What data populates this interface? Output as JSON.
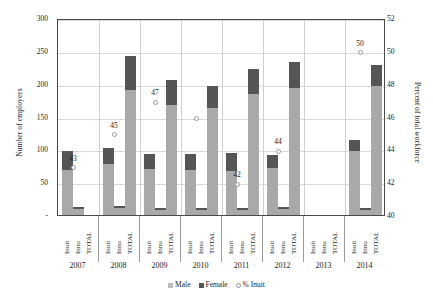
{
  "chart_data": {
    "type": "bar",
    "title": "",
    "subtitle": "",
    "grid": true,
    "legend_position": "bottom",
    "ylabel": "Number of employees",
    "y2label": "Percent of total workforce",
    "xlabel": "",
    "ylim": [
      0,
      300
    ],
    "yticks": [
      "-",
      "50",
      "100",
      "150",
      "200",
      "250",
      "300"
    ],
    "ytick_values": [
      0,
      50,
      100,
      150,
      200,
      250,
      300
    ],
    "y2lim": [
      40,
      52
    ],
    "y2ticks": [
      "40",
      "42",
      "44",
      "46",
      "48",
      "50",
      "52"
    ],
    "y2tick_values": [
      40,
      42,
      44,
      46,
      48,
      50,
      52
    ],
    "categories": [
      "Inuit",
      "Innu",
      "TOTAL"
    ],
    "groups": [
      "2007",
      "2008",
      "2009",
      "2010",
      "2011",
      "2012",
      "2013",
      "2014"
    ],
    "series": [
      {
        "name": "Male",
        "color": "#a9a9a9"
      },
      {
        "name": "Female",
        "color": "#555555"
      },
      {
        "name": "% Inuit",
        "color": "#fdfdfd"
      }
    ],
    "legend_entries": [
      "Male",
      "Female",
      "% Inuit"
    ],
    "bars": [
      {
        "group": "2007",
        "category": "Inuit",
        "male": 68,
        "female": 29,
        "total": 97
      },
      {
        "group": "2007",
        "category": "Innu",
        "male": 9,
        "female": 3,
        "total": 12
      },
      {
        "group": "2007",
        "category": "TOTAL",
        "male": 0,
        "female": 0,
        "total": 0
      },
      {
        "group": "2008",
        "category": "Inuit",
        "male": 77,
        "female": 25,
        "total": 102
      },
      {
        "group": "2008",
        "category": "Innu",
        "male": 10,
        "female": 4,
        "total": 14
      },
      {
        "group": "2008",
        "category": "TOTAL",
        "male": 190,
        "female": 52,
        "total": 242
      },
      {
        "group": "2009",
        "category": "Inuit",
        "male": 70,
        "female": 23,
        "total": 93
      },
      {
        "group": "2009",
        "category": "Innu",
        "male": 8,
        "female": 3,
        "total": 11
      },
      {
        "group": "2009",
        "category": "TOTAL",
        "male": 167,
        "female": 39,
        "total": 206
      },
      {
        "group": "2010",
        "category": "Inuit",
        "male": 69,
        "female": 24,
        "total": 93
      },
      {
        "group": "2010",
        "category": "Innu",
        "male": 7,
        "female": 3,
        "total": 10
      },
      {
        "group": "2010",
        "category": "TOTAL",
        "male": 163,
        "female": 34,
        "total": 197
      },
      {
        "group": "2011",
        "category": "Inuit",
        "male": 67,
        "female": 27,
        "total": 94
      },
      {
        "group": "2011",
        "category": "Innu",
        "male": 8,
        "female": 3,
        "total": 11
      },
      {
        "group": "2011",
        "category": "TOTAL",
        "male": 184,
        "female": 38,
        "total": 222
      },
      {
        "group": "2012",
        "category": "Inuit",
        "male": 72,
        "female": 20,
        "total": 92
      },
      {
        "group": "2012",
        "category": "Innu",
        "male": 9,
        "female": 3,
        "total": 12
      },
      {
        "group": "2012",
        "category": "TOTAL",
        "male": 194,
        "female": 39,
        "total": 233
      },
      {
        "group": "2013",
        "category": "Inuit",
        "male": 0,
        "female": 0,
        "total": 0
      },
      {
        "group": "2013",
        "category": "Innu",
        "male": 0,
        "female": 0,
        "total": 0
      },
      {
        "group": "2013",
        "category": "TOTAL",
        "male": 0,
        "female": 0,
        "total": 0
      },
      {
        "group": "2014",
        "category": "Inuit",
        "male": 98,
        "female": 17,
        "total": 115
      },
      {
        "group": "2014",
        "category": "Innu",
        "male": 8,
        "female": 3,
        "total": 11
      },
      {
        "group": "2014",
        "category": "TOTAL",
        "male": 197,
        "female": 32,
        "total": 229
      }
    ],
    "pct_inuit": [
      {
        "group": "2007",
        "value": 43,
        "label": "43",
        "label_shown": true
      },
      {
        "group": "2008",
        "value": 45,
        "label": "45",
        "label_shown": true
      },
      {
        "group": "2009",
        "value": 47,
        "label": "47",
        "label_shown": true
      },
      {
        "group": "2010",
        "value": 46,
        "label": "",
        "label_shown": false
      },
      {
        "group": "2011",
        "value": 42,
        "label": "42",
        "label_shown": true
      },
      {
        "group": "2012",
        "value": 44,
        "label": "44",
        "label_shown": true
      },
      {
        "group": "2014",
        "value": 50,
        "label": "50",
        "label_shown": true
      }
    ]
  }
}
